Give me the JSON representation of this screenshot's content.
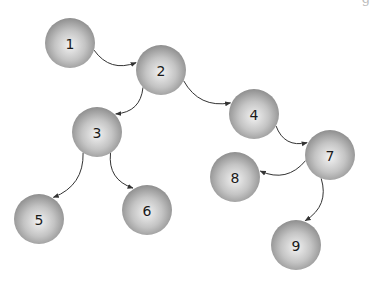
{
  "diagram": {
    "type": "directed-tree",
    "top_fragment_text": "g",
    "node_radius": 25,
    "colors": {
      "node_center": "#f2f2f2",
      "node_mid": "#c4c4c4",
      "node_edge": "#8e8e8e",
      "edge": "#333333",
      "label": "#1a1a1a"
    },
    "nodes": [
      {
        "id": "1",
        "label": "1",
        "x": 70,
        "y": 43
      },
      {
        "id": "2",
        "label": "2",
        "x": 161,
        "y": 70
      },
      {
        "id": "3",
        "label": "3",
        "x": 97,
        "y": 132
      },
      {
        "id": "4",
        "label": "4",
        "x": 254,
        "y": 114
      },
      {
        "id": "5",
        "label": "5",
        "x": 39,
        "y": 219
      },
      {
        "id": "6",
        "label": "6",
        "x": 147,
        "y": 210
      },
      {
        "id": "7",
        "label": "7",
        "x": 330,
        "y": 155
      },
      {
        "id": "8",
        "label": "8",
        "x": 235,
        "y": 177
      },
      {
        "id": "9",
        "label": "9",
        "x": 296,
        "y": 245
      }
    ],
    "edges": [
      {
        "from": "1",
        "to": "2"
      },
      {
        "from": "2",
        "to": "3"
      },
      {
        "from": "2",
        "to": "4"
      },
      {
        "from": "3",
        "to": "5"
      },
      {
        "from": "3",
        "to": "6"
      },
      {
        "from": "4",
        "to": "7"
      },
      {
        "from": "7",
        "to": "8"
      },
      {
        "from": "7",
        "to": "9"
      }
    ]
  }
}
